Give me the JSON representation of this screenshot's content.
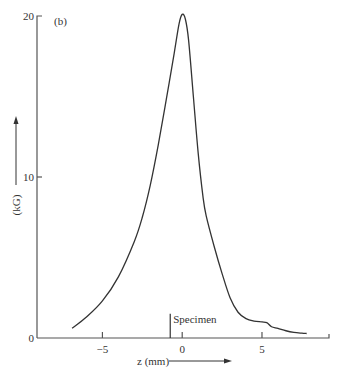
{
  "chart_data": {
    "type": "line",
    "panel_label": "(b)",
    "title": "",
    "xlabel": "z (mm)",
    "ylabel": "(kG)",
    "xlim": [
      -9.1,
      9.2
    ],
    "ylim": [
      0,
      20
    ],
    "x_ticks": [
      -5,
      0,
      5
    ],
    "x_tick_labels": [
      "−5",
      "0",
      "5"
    ],
    "y_ticks": [
      0,
      10,
      20
    ],
    "y_tick_labels": [
      "0",
      "10",
      "20"
    ],
    "grid": false,
    "legend": "none",
    "annotations": [
      {
        "text": "Specimen",
        "x": -0.75,
        "marker_height": 1.5
      }
    ],
    "series": [
      {
        "name": "B field",
        "x": [
          -6.9,
          -6.0,
          -5.0,
          -4.0,
          -3.0,
          -2.5,
          -2.0,
          -1.5,
          -1.0,
          -0.5,
          -0.2,
          0.0,
          0.2,
          0.4,
          0.7,
          1.0,
          1.3,
          1.5,
          2.0,
          2.5,
          3.0,
          3.5,
          4.0,
          4.5,
          5.0,
          5.3,
          5.6,
          6.0,
          6.5,
          7.0,
          7.5,
          7.8
        ],
        "y": [
          0.6,
          1.3,
          2.3,
          3.8,
          6.0,
          7.5,
          9.5,
          12.0,
          14.8,
          17.7,
          19.5,
          20.1,
          19.8,
          18.5,
          15.0,
          11.5,
          8.8,
          7.6,
          5.7,
          4.0,
          2.5,
          1.6,
          1.2,
          1.05,
          1.0,
          0.95,
          0.7,
          0.6,
          0.45,
          0.35,
          0.3,
          0.28
        ]
      }
    ]
  }
}
